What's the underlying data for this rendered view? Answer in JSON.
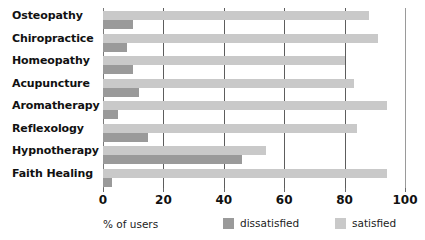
{
  "chart_data": {
    "type": "bar",
    "orientation": "horizontal",
    "title": "",
    "xlabel": "% of users",
    "ylabel": "",
    "xlim": [
      0,
      100
    ],
    "xticks": [
      0,
      20,
      40,
      60,
      80,
      100
    ],
    "xtick_labels": [
      "0",
      "20",
      "40",
      "60",
      "80",
      "100"
    ],
    "grid": true,
    "grid_axis": "x",
    "legend_position": "bottom",
    "categories": [
      "Osteopathy",
      "Chiropractice",
      "Homeopathy",
      "Acupuncture",
      "Aromatherapy",
      "Reflexology",
      "Hypnotherapy",
      "Faith Healing"
    ],
    "series": [
      {
        "name": "satisfied",
        "color": "#c9c9c9",
        "values": [
          88,
          91,
          80,
          83,
          94,
          84,
          54,
          94
        ]
      },
      {
        "name": "dissatisfied",
        "color": "#9a9a9a",
        "values": [
          10,
          8,
          10,
          12,
          5,
          15,
          46,
          3
        ]
      }
    ]
  },
  "legend": {
    "caption": "% of users",
    "entries": [
      {
        "label": "dissatisfied",
        "color": "#9a9a9a"
      },
      {
        "label": "satisfied",
        "color": "#c9c9c9"
      }
    ]
  }
}
